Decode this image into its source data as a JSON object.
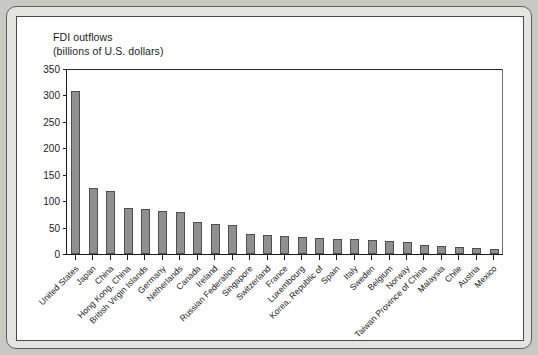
{
  "figure": {
    "background_color": "#ffffff",
    "frame_color": "#4a4a4a",
    "page_background": "#c9c9c4"
  },
  "chart_data": {
    "type": "bar",
    "title": "FDI outflows",
    "subtitle": "(billions of U.S. dollars)",
    "xlabel": "",
    "ylabel": "",
    "ylim": [
      0,
      350
    ],
    "yticks": [
      0,
      50,
      100,
      150,
      200,
      250,
      300,
      350
    ],
    "ytick_labels": [
      "0",
      "50",
      "100",
      "150",
      "200",
      "250",
      "300",
      "350"
    ],
    "grid": false,
    "legend": false,
    "bar_color": "#8f8f8f",
    "bar_edge_color": "#4f4f4f",
    "categories": [
      "United States",
      "Japan",
      "China",
      "Hong Kong, China",
      "British Virgin Islands",
      "Germany",
      "Netherlands",
      "Canada",
      "Ireland",
      "Russian Federation",
      "Singapore",
      "Switzerland",
      "France",
      "Luxembourg",
      "Korea, Republic of",
      "Spain",
      "Italy",
      "Sweden",
      "Belgium",
      "Norway",
      "Taiwan Province of China",
      "Malaysia",
      "Chile",
      "Austria",
      "Mexico"
    ],
    "values": [
      308,
      125,
      120,
      88,
      85,
      81,
      80,
      60,
      57,
      55,
      38,
      36,
      35,
      32,
      30,
      29,
      28,
      27,
      24,
      22,
      17,
      15,
      14,
      12,
      10
    ]
  }
}
